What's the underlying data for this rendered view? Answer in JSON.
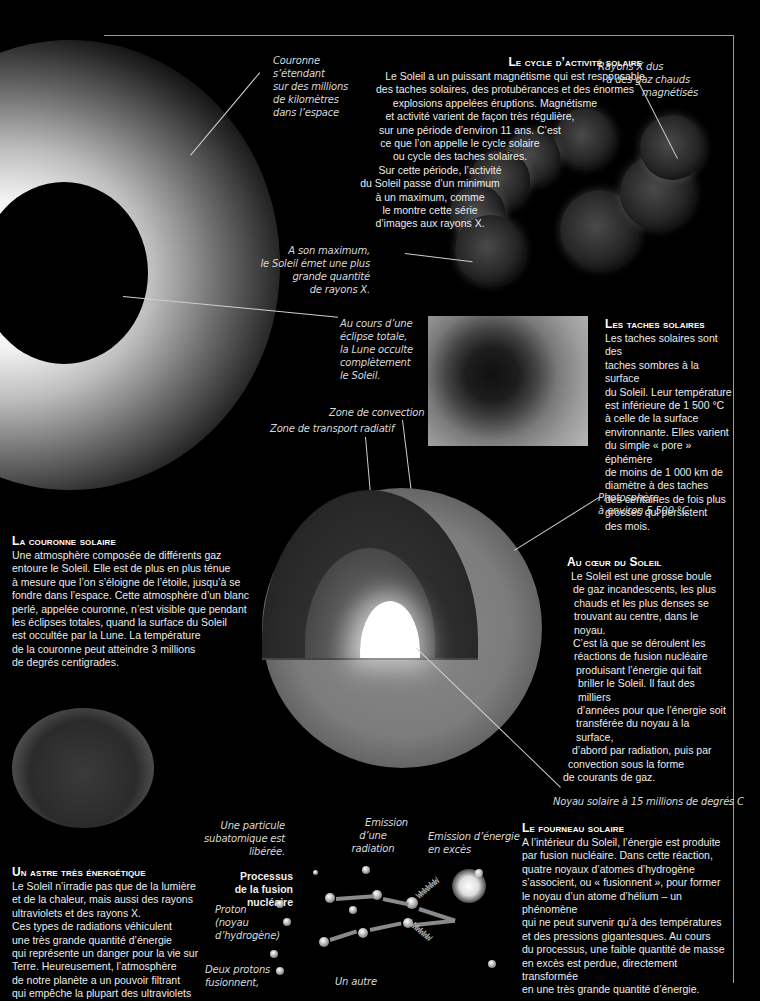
{
  "sections": {
    "cycle": {
      "title": "Le cycle d’activité solaire",
      "lines": [
        "Le Soleil a un puissant magnétisme qui est responsable",
        "des taches solaires, des protubérances et des énormes",
        "explosions appelées éruptions. Magnétisme",
        "et activité varient de façon très régulière,",
        "sur une période d’environ 11 ans. C’est",
        "ce que l’on appelle le cycle solaire",
        "ou cycle des taches solaires.",
        "Sur cette période, l’activité",
        "du Soleil  passe d’un minimum",
        "à un maximum, comme",
        "le montre cette série",
        "d’images aux rayons X."
      ]
    },
    "sunspots": {
      "title": "Les taches solaires",
      "lines": [
        "Les taches solaires sont des",
        "taches sombres à la surface",
        "du Soleil. Leur température",
        "est inférieure de 1 500 °C",
        "à celle de la surface",
        "environnante. Elles varient",
        "du simple « pore » éphémère",
        "de moins de 1 000 km de",
        "diamètre à des taches",
        "des centaines de fois plus",
        "grosses qui persistent",
        "des mois."
      ]
    },
    "corona": {
      "title": "La couronne solaire",
      "lines": [
        "Une atmosphère composée de différents gaz",
        "entoure le Soleil. Elle est de plus en plus ténue",
        "à mesure que l’on s’éloigne de l’étoile, jusqu’à se",
        "fondre dans l’espace. Cette atmosphère d’un blanc",
        "perlé, appelée couronne, n’est visible que pendant",
        "les éclipses totales, quand la surface du Soleil",
        "est occultée par la Lune. La température",
        "de la couronne peut atteindre 3 millions",
        "de degrés centigrades."
      ]
    },
    "core": {
      "title": "Au cœur du Soleil",
      "lines": [
        "Le Soleil est une grosse boule",
        "de gaz incandescents, les plus",
        "chauds et les plus denses se",
        "trouvant au centre, dans le noyau.",
        "C’est là que se déroulent les",
        "réactions de fusion nucléaire",
        "produisant l’énergie qui fait",
        "briller le Soleil. Il faut des milliers",
        "d’années pour que l’énergie soit",
        "transférée du noyau à la surface,",
        "d’abord par radiation, puis par",
        "convection sous la forme",
        "de courants de gaz."
      ]
    },
    "energetic": {
      "title": "Un astre très énergétique",
      "lines": [
        "Le Soleil n’irradie pas que de la lumière",
        "et de la chaleur, mais aussi des rayons",
        "ultraviolets et des rayons X.",
        "Ces types de radiations véhiculent",
        "une très grande quantité d’énergie",
        "qui représente un danger pour la vie sur",
        "Terre. Heureusement, l’atmosphère",
        "de notre planète a un pouvoir filtrant",
        "qui empêche la plupart des ultraviolets"
      ]
    },
    "furnace": {
      "title": "Le fourneau solaire",
      "lines": [
        "A l’intérieur du Soleil, l’énergie est produite",
        "par  fusion nucléaire. Dans cette réaction,",
        "quatre noyaux d’atomes d’hydrogène",
        "s’associent, ou « fusionnent », pour former",
        "le noyau d’un atome d’hélium – un phénomène",
        "qui ne peut survenir qu’à des températures",
        "et des pressions gigantesques. Au cours",
        "du processus, une faible quantité de masse",
        "en excès est perdue, directement transformée",
        "en une très grande quantité d’énergie."
      ]
    }
  },
  "captions": {
    "corona_extent": [
      "Couronne",
      "s’étendant",
      "sur des millions",
      "de kilomètres",
      "dans l’espace"
    ],
    "xray_gas": [
      "Rayons X dus",
      "à des gaz chauds",
      "magnétisés"
    ],
    "maximum": [
      "A son maximum,",
      "le Soleil émet une plus",
      "grande quantité",
      "de rayons X."
    ],
    "eclipse": [
      "Au cours d’une",
      "éclipse totale,",
      "la Lune occulte",
      "complètement",
      "le Soleil."
    ],
    "convection_zone": "Zone de convection",
    "radiative_zone": "Zone de transport radiatif",
    "photosphere": [
      "Photosphère",
      "à environ 5 500 °C"
    ],
    "solar_core": "Noyau solaire à 15 millions de degrés C",
    "particle": [
      "Une particule",
      "subatomique est libérée."
    ],
    "radiation": [
      "Emission",
      "d’une radiation"
    ],
    "excess_energy": [
      "Emission d’énergie",
      "en excès"
    ],
    "process_title": [
      "Processus",
      "de la fusion nucléaire"
    ],
    "proton": [
      "Proton",
      "(noyau",
      "d’hydrogène)"
    ],
    "two_protons": [
      "Deux protons",
      "fusionnent,"
    ],
    "another": "Un autre",
    "bottom_right": "Rayonnement  ...  idrogène fusionnent"
  }
}
